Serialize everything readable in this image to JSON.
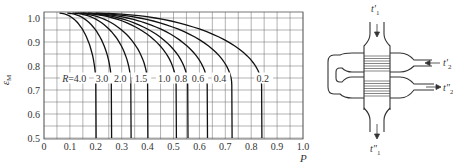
{
  "chart_data": {
    "type": "line",
    "title": "",
    "xlabel": "P",
    "ylabel": "ε_M",
    "xlim": [
      0,
      1.0
    ],
    "ylim": [
      0.5,
      1.02
    ],
    "grid": true,
    "grid_step_x": 0.05,
    "grid_step_y": 0.05,
    "x_ticks": [
      "0",
      "0.1",
      "0.2",
      "0.3",
      "0.4",
      "0.5",
      "0.6",
      "0.7",
      "0.8",
      "0.9",
      "1.0"
    ],
    "y_ticks": [
      "1.0",
      "0.9",
      "0.8",
      "0.7",
      "0.6",
      "0.5"
    ],
    "series_label_prefix": "R=",
    "series": [
      {
        "name": "4.0",
        "label": "R=4.0",
        "p_start": 0.06,
        "p_end": 0.2
      },
      {
        "name": "3.0",
        "label": "3.0",
        "p_start": 0.09,
        "p_end": 0.26
      },
      {
        "name": "2.0",
        "label": "2.0",
        "p_start": 0.11,
        "p_end": 0.335
      },
      {
        "name": "1.5",
        "label": "1.5",
        "p_start": 0.12,
        "p_end": 0.4
      },
      {
        "name": "1.0",
        "label": "1.0",
        "p_start": 0.13,
        "p_end": 0.51
      },
      {
        "name": "0.8",
        "label": "0.8",
        "p_start": 0.14,
        "p_end": 0.555
      },
      {
        "name": "0.6",
        "label": "0.6",
        "p_start": 0.15,
        "p_end": 0.63
      },
      {
        "name": "0.4",
        "label": "0.4",
        "p_start": 0.17,
        "p_end": 0.725
      },
      {
        "name": "0.2",
        "label": "0.2",
        "p_start": 0.2,
        "p_end": 0.84
      }
    ],
    "label_row_epsilon": 0.75,
    "label_positions_p": [
      0.07,
      0.2,
      0.27,
      0.35,
      0.44,
      0.505,
      0.57,
      0.655,
      0.82
    ]
  },
  "diagram": {
    "labels": {
      "t1_in": "t'",
      "t1_in_sub": "1",
      "t2_in": "t'",
      "t2_in_sub": "2",
      "t2_out": "t\"",
      "t2_out_sub": "2",
      "t1_out": "t\"",
      "t1_out_sub": "1"
    }
  }
}
